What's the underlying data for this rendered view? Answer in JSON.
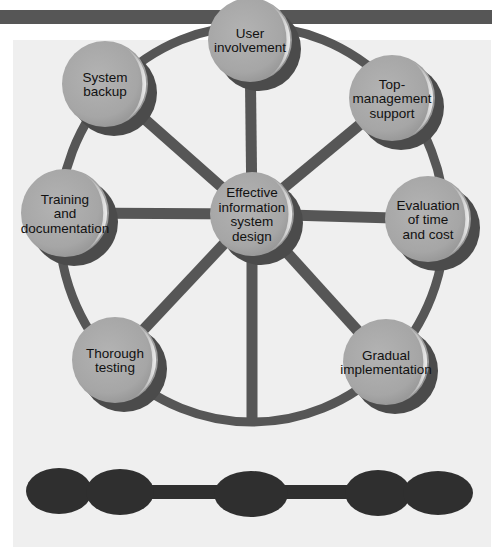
{
  "diagram": {
    "title": "",
    "center_node": {
      "id": "center",
      "lines": [
        "Effective",
        "information",
        "system",
        "design"
      ],
      "cx": 252,
      "cy": 214,
      "r": 42
    },
    "outer_nodes": [
      {
        "id": "user-involvement",
        "lines": [
          "User",
          "involvement"
        ],
        "cx": 250,
        "cy": 40,
        "r": 42
      },
      {
        "id": "top-management-support",
        "lines": [
          "Top-",
          "management",
          "support"
        ],
        "cx": 392,
        "cy": 98,
        "r": 43
      },
      {
        "id": "evaluation-of-time-and-cost",
        "lines": [
          "Evaluation",
          "of time",
          "and cost"
        ],
        "cx": 428,
        "cy": 219,
        "r": 43
      },
      {
        "id": "gradual-implementation",
        "lines": [
          "Gradual",
          "implementation"
        ],
        "cx": 386,
        "cy": 362,
        "r": 43
      },
      {
        "id": "thorough-testing",
        "lines": [
          "Thorough",
          "testing"
        ],
        "cx": 115,
        "cy": 360,
        "r": 43
      },
      {
        "id": "training-and-documentation",
        "lines": [
          "Training",
          "and",
          "documentation"
        ],
        "cx": 65,
        "cy": 213,
        "r": 44
      },
      {
        "id": "system-backup",
        "lines": [
          "System",
          "backup"
        ],
        "cx": 105,
        "cy": 84,
        "r": 43
      }
    ],
    "spokes_bottom_extra": [
      {
        "x": 252,
        "y": 422
      }
    ],
    "ring": {
      "cx": 252,
      "cy": 224,
      "rx": 193,
      "ry": 198
    },
    "bottom_chain": {
      "ellipses": [
        {
          "cx": 59,
          "cy": 491,
          "rx": 33,
          "ry": 23
        },
        {
          "cx": 120,
          "cy": 492,
          "rx": 34,
          "ry": 23
        },
        {
          "cx": 251,
          "cy": 494,
          "rx": 37,
          "ry": 23
        },
        {
          "cx": 378,
          "cy": 493,
          "rx": 33,
          "ry": 23
        },
        {
          "cx": 438,
          "cy": 493,
          "rx": 35,
          "ry": 22
        }
      ],
      "bar": {
        "x1": 59,
        "x2": 438,
        "y": 492,
        "h": 14
      }
    },
    "colors": {
      "top_bar": "#565656",
      "panel_bg": "#efefef",
      "ring": "#565656",
      "node_fill": "#a9a9a9",
      "node_shadow": "#4b4b4b",
      "node_highlight": "#d8d8d8",
      "chain": "#2f2f2f",
      "label": "#111111"
    }
  }
}
